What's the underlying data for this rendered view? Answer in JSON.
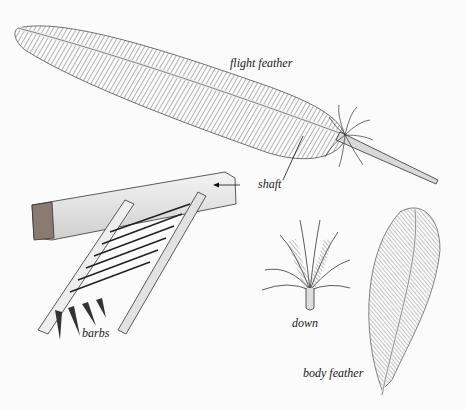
{
  "diagram": {
    "colors": {
      "background": "#fbfbfb",
      "ink": "#1a1a1a",
      "shade": "#7a7a7a",
      "light": "#e6e6e6"
    },
    "labels": {
      "flight_feather": "flight feather",
      "shaft": "shaft",
      "barbs": "barbs",
      "down": "down",
      "body_feather": "body feather"
    },
    "components": [
      {
        "id": "flight-feather",
        "label": "flight feather"
      },
      {
        "id": "shaft-detail",
        "label": "shaft"
      },
      {
        "id": "barbs-detail",
        "label": "barbs"
      },
      {
        "id": "down-feather",
        "label": "down"
      },
      {
        "id": "body-feather",
        "label": "body feather"
      }
    ]
  }
}
